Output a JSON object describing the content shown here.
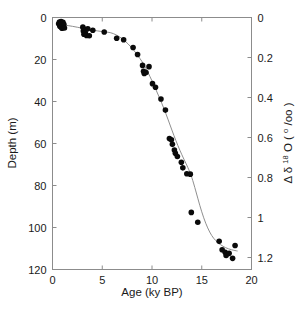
{
  "chart_data": {
    "type": "scatter",
    "title": "",
    "xlabel": "Age (ky BP)",
    "ylabel": "Depth (m)",
    "y2label": "Δ δ 18 O ( o /oo)",
    "y2label_parts": {
      "delta_cap": "Δ",
      "delta_low": "δ",
      "superscript": "18",
      "oxygen": "O",
      "units_open": "(",
      "units_sup": "o",
      "units_rest": "/oo",
      "units_close": ")"
    },
    "xlim": [
      0,
      20
    ],
    "ylim": [
      120,
      0
    ],
    "y2lim": [
      1.26,
      0
    ],
    "xticks": [
      0,
      5,
      10,
      15,
      20
    ],
    "xticklabels": [
      "0",
      "5",
      "10",
      "15",
      "20"
    ],
    "yticks": [
      0,
      20,
      40,
      60,
      80,
      100,
      120
    ],
    "yticklabels": [
      "0",
      "20",
      "40",
      "60",
      "80",
      "100",
      "120"
    ],
    "y2ticks": [
      0,
      0.2,
      0.4,
      0.6,
      0.8,
      1.0,
      1.2
    ],
    "y2ticklabels": [
      "0",
      "0.2",
      "0.4",
      "0.6",
      "0.8",
      "1",
      "1.2"
    ],
    "grid": false,
    "legend": null,
    "marker_color": "#0a0a0a",
    "curve_color": "#8f8f8f",
    "axis_color": "#8c8c8c",
    "series": [
      {
        "name": "depth vs age",
        "marker": "filled-circle",
        "points": [
          [
            0.62,
            3.0
          ],
          [
            0.7,
            2.2
          ],
          [
            0.74,
            4.2
          ],
          [
            0.8,
            3.1
          ],
          [
            0.86,
            1.9
          ],
          [
            0.88,
            4.6
          ],
          [
            0.92,
            2.7
          ],
          [
            0.95,
            5.1
          ],
          [
            1.0,
            3.6
          ],
          [
            1.05,
            2.3
          ],
          [
            1.08,
            4.4
          ],
          [
            1.14,
            3.2
          ],
          [
            1.2,
            5.0
          ],
          [
            3.05,
            4.6
          ],
          [
            3.1,
            6.4
          ],
          [
            3.16,
            8.0
          ],
          [
            3.25,
            5.6
          ],
          [
            3.3,
            7.3
          ],
          [
            3.42,
            8.6
          ],
          [
            3.55,
            5.4
          ],
          [
            3.7,
            8.7
          ],
          [
            4.05,
            6.1
          ],
          [
            5.2,
            6.9
          ],
          [
            6.45,
            9.9
          ],
          [
            7.15,
            10.6
          ],
          [
            8.1,
            14.3
          ],
          [
            8.55,
            17.6
          ],
          [
            9.05,
            22.8
          ],
          [
            9.15,
            25.6
          ],
          [
            9.22,
            26.7
          ],
          [
            9.4,
            26.2
          ],
          [
            9.7,
            23.4
          ],
          [
            10.05,
            31.5
          ],
          [
            10.35,
            33.2
          ],
          [
            10.9,
            38.8
          ],
          [
            11.35,
            44.1
          ],
          [
            11.75,
            57.6
          ],
          [
            11.95,
            58.2
          ],
          [
            12.05,
            60.4
          ],
          [
            12.25,
            63.1
          ],
          [
            12.35,
            64.7
          ],
          [
            12.55,
            66.2
          ],
          [
            12.95,
            68.9
          ],
          [
            13.1,
            71.6
          ],
          [
            13.5,
            74.4
          ],
          [
            13.85,
            74.6
          ],
          [
            13.95,
            92.8
          ],
          [
            14.6,
            97.5
          ],
          [
            16.75,
            106.6
          ],
          [
            17.05,
            110.6
          ],
          [
            17.35,
            111.8
          ],
          [
            17.45,
            113.3
          ],
          [
            17.75,
            112.3
          ],
          [
            18.1,
            114.7
          ],
          [
            18.35,
            108.6
          ]
        ]
      }
    ],
    "fit_curve": {
      "name": "sigmoid fit",
      "points": [
        [
          0.6,
          3.3
        ],
        [
          1.2,
          3.6
        ],
        [
          2.0,
          4.2
        ],
        [
          3.0,
          5.1
        ],
        [
          4.0,
          6.0
        ],
        [
          5.0,
          6.7
        ],
        [
          5.8,
          7.2
        ],
        [
          6.4,
          8.3
        ],
        [
          7.0,
          10.1
        ],
        [
          7.6,
          12.6
        ],
        [
          8.2,
          15.8
        ],
        [
          8.8,
          19.6
        ],
        [
          9.2,
          22.6
        ],
        [
          9.6,
          26.2
        ],
        [
          10.0,
          30.2
        ],
        [
          10.4,
          34.4
        ],
        [
          10.8,
          38.8
        ],
        [
          11.2,
          43.4
        ],
        [
          11.6,
          48.4
        ],
        [
          12.0,
          53.6
        ],
        [
          12.4,
          58.6
        ],
        [
          12.8,
          63.2
        ],
        [
          13.2,
          67.4
        ],
        [
          13.6,
          71.4
        ],
        [
          14.0,
          76.2
        ],
        [
          14.4,
          82.6
        ],
        [
          14.8,
          89.4
        ],
        [
          15.2,
          95.4
        ],
        [
          15.6,
          100.2
        ],
        [
          16.0,
          103.8
        ],
        [
          16.4,
          106.2
        ],
        [
          16.9,
          108.2
        ],
        [
          17.4,
          109.6
        ],
        [
          18.0,
          110.6
        ],
        [
          18.6,
          111.2
        ]
      ]
    }
  }
}
